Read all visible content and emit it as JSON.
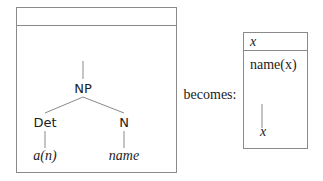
{
  "left_drs": {
    "header": "",
    "tree": {
      "root": "NP",
      "children": [
        {
          "label": "Det",
          "leaf": "a(n)"
        },
        {
          "label": "N",
          "leaf": "name"
        }
      ]
    }
  },
  "connector": "becomes:",
  "right_drs": {
    "header": "x",
    "condition": "name(x)",
    "leaf": "x"
  },
  "colors": {
    "border": "#8a8a8a",
    "line": "#8a8a8a",
    "text": "#222222"
  }
}
